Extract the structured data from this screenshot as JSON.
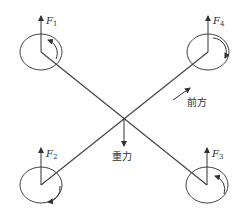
{
  "diagram": {
    "type": "quadrotor-force-diagram",
    "center": {
      "x": 124,
      "y": 118
    },
    "rotors": [
      {
        "id": "rotor-1",
        "label": "F",
        "sub": "1",
        "cx": 41,
        "cy": 52,
        "rotation": "counterclockwise"
      },
      {
        "id": "rotor-4",
        "label": "F",
        "sub": "4",
        "cx": 208,
        "cy": 52,
        "rotation": "clockwise"
      },
      {
        "id": "rotor-2",
        "label": "F",
        "sub": "2",
        "cx": 41,
        "cy": 185,
        "rotation": "clockwise"
      },
      {
        "id": "rotor-3",
        "label": "F",
        "sub": "3",
        "cx": 207,
        "cy": 185,
        "rotation": "counterclockwise"
      }
    ],
    "gravity_label": "重力",
    "forward_label": "前方",
    "line_color": "#444444"
  }
}
